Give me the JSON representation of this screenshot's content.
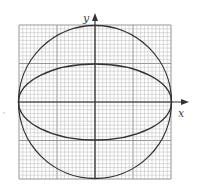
{
  "diagram": {
    "type": "conic-sections-on-graph-paper",
    "axes": {
      "x_label": "x",
      "y_label": "y"
    },
    "grid": {
      "major_divisions": 4,
      "minor_per_major": 10,
      "minor_color": "#b8b8b8",
      "major_color": "#8a8a8a"
    },
    "shapes": [
      {
        "name": "circle",
        "center": [
          0,
          0
        ],
        "radius": 2
      },
      {
        "name": "ellipse",
        "center": [
          0,
          0
        ],
        "semi_major_x": 2,
        "semi_minor_y": 1
      }
    ],
    "stroke_color": "#333333"
  }
}
